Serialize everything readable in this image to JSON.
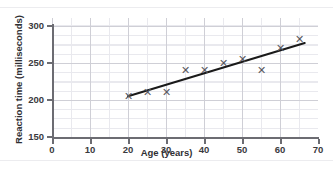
{
  "page": {
    "background_color": "#ffffff",
    "clipped_top_text": ""
  },
  "chart_data": {
    "type": "scatter",
    "title": "",
    "xlabel": "Age (years)",
    "ylabel": "Reaction time (milliseconds)",
    "xlim": [
      0,
      70
    ],
    "ylim": [
      150,
      300
    ],
    "xticks": [
      0,
      10,
      20,
      30,
      40,
      50,
      60,
      70
    ],
    "yticks": [
      150,
      200,
      250,
      300
    ],
    "grid": true,
    "grid_minor": true,
    "legend": "none",
    "marker": "x",
    "marker_color": "#58585e",
    "line_color": "#1a1a1a",
    "axis_color": "#6c6c72",
    "grid_color": "#cfcfd6",
    "grid_minor_color": "#e9e9ee",
    "x": [
      20,
      25,
      30,
      35,
      40,
      45,
      50,
      55,
      60,
      65
    ],
    "y": [
      205,
      211,
      211,
      240,
      240,
      250,
      256,
      240,
      270,
      282
    ],
    "points": [
      {
        "age": 20,
        "reaction_time": 205
      },
      {
        "age": 25,
        "reaction_time": 211
      },
      {
        "age": 30,
        "reaction_time": 211
      },
      {
        "age": 35,
        "reaction_time": 240
      },
      {
        "age": 40,
        "reaction_time": 240
      },
      {
        "age": 45,
        "reaction_time": 250
      },
      {
        "age": 50,
        "reaction_time": 256
      },
      {
        "age": 55,
        "reaction_time": 240
      },
      {
        "age": 60,
        "reaction_time": 270
      },
      {
        "age": 65,
        "reaction_time": 282
      }
    ],
    "trend_line": {
      "label": "line of best fit",
      "x0": 20,
      "y0": 205,
      "x1": 66.5,
      "y1": 277
    }
  },
  "ticklabels": {
    "x": [
      "0",
      "10",
      "20",
      "30",
      "40",
      "50",
      "60",
      "70"
    ],
    "y": [
      "150",
      "200",
      "250",
      "300"
    ]
  }
}
